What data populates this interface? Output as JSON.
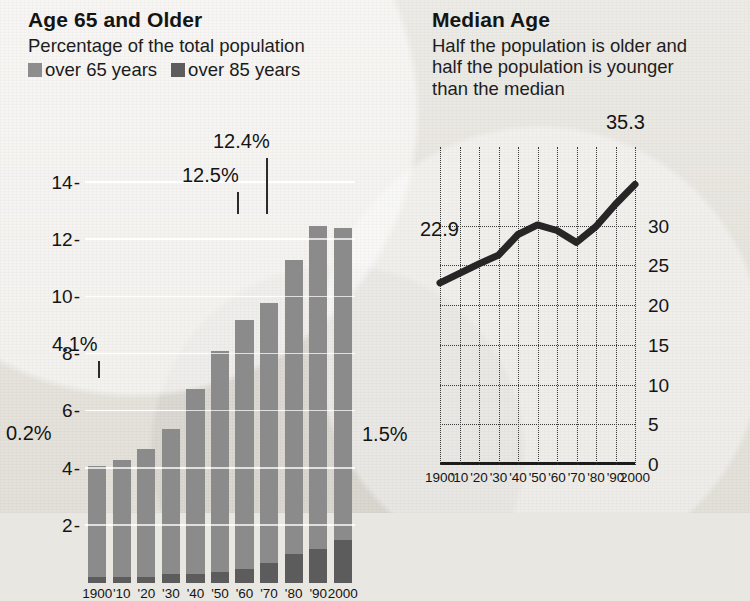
{
  "left_panel": {
    "title": "Age 65 and Older",
    "subtitle": "Percentage of the total population",
    "legend": [
      {
        "label": "over 65 years",
        "color": "#8b8b8b",
        "swatch": "legend-swatch-over-65"
      },
      {
        "label": "over 85 years",
        "color": "#5c5c5c",
        "swatch": "legend-swatch-over-85"
      }
    ],
    "callouts": [
      {
        "text": "4.1%",
        "points_to": "1900"
      },
      {
        "text": "0.2%",
        "points_to": "1900-over-85"
      },
      {
        "text": "12.5%",
        "points_to": "1990"
      },
      {
        "text": "12.4%",
        "points_to": "2000"
      },
      {
        "text": "1.5%",
        "points_to": "2000-over-85"
      }
    ]
  },
  "right_panel": {
    "title": "Median Age",
    "subtitle_line1": "Half the population is older and",
    "subtitle_line2": "half the population is younger",
    "subtitle_line3": "than the median",
    "callouts": [
      {
        "text": "22.9",
        "points_to": "1900"
      },
      {
        "text": "35.3",
        "points_to": "2000"
      }
    ]
  },
  "chart_data": [
    {
      "type": "bar",
      "title": "Age 65 and Older",
      "subtitle": "Percentage of the total population",
      "xlabel": "",
      "ylabel": "",
      "ylim": [
        0,
        15
      ],
      "yticks": [
        2,
        4,
        6,
        8,
        10,
        12,
        14
      ],
      "grid": true,
      "stacked": true,
      "legend_position": "top",
      "categories": [
        "1900",
        "'10",
        "'20",
        "'30",
        "'40",
        "'50",
        "'60",
        "'70",
        "'80",
        "'90",
        "2000"
      ],
      "series": [
        {
          "name": "over 65 years",
          "color": "#8b8b8b",
          "values": [
            4.1,
            4.3,
            4.7,
            5.4,
            6.8,
            8.1,
            9.2,
            9.8,
            11.3,
            12.5,
            12.4
          ]
        },
        {
          "name": "over 85 years",
          "color": "#5c5c5c",
          "values": [
            0.2,
            0.2,
            0.2,
            0.3,
            0.3,
            0.4,
            0.5,
            0.7,
            1.0,
            1.2,
            1.5
          ]
        }
      ],
      "data_labels": {
        "1900": "4.1%",
        "1990": "12.5%",
        "2000": "12.4%"
      },
      "data_labels_over_85": {
        "1900": "0.2%",
        "2000": "1.5%"
      }
    },
    {
      "type": "line",
      "title": "Median Age",
      "subtitle": "Half the population is older and half the population is younger than the median",
      "xlabel": "",
      "ylabel": "",
      "ylim": [
        0,
        40
      ],
      "yticks": [
        0,
        5,
        10,
        15,
        20,
        25,
        30
      ],
      "grid": true,
      "y_axis_side": "right",
      "x": [
        "1900",
        "'10",
        "'20",
        "'30",
        "'40",
        "'50",
        "'60",
        "'70",
        "'80",
        "'90",
        "2000"
      ],
      "values": [
        22.9,
        24.1,
        25.3,
        26.4,
        29.0,
        30.2,
        29.5,
        28.0,
        30.0,
        32.8,
        35.3
      ],
      "data_labels": {
        "1900": "22.9",
        "2000": "35.3"
      },
      "line_color": "#262626"
    }
  ]
}
